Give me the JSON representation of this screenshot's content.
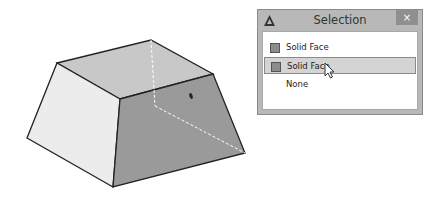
{
  "viewport": {
    "shape": "frustum",
    "colors": {
      "top_face": "#c8c8c8",
      "left_face": "#ececec",
      "right_face": "#9a9a9a",
      "edge": "#222222",
      "hidden_edge": "#ffffff"
    }
  },
  "dialog": {
    "title": "Selection",
    "close_label": "×",
    "items": [
      {
        "label": "Solid Face",
        "has_swatch": true,
        "selected": false
      },
      {
        "label": "Solid Face",
        "has_swatch": true,
        "selected": true
      },
      {
        "label": "None",
        "has_swatch": false,
        "selected": false
      }
    ]
  }
}
